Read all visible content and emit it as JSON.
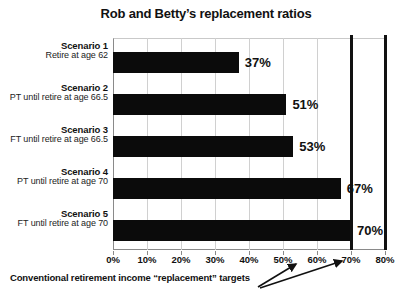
{
  "chart_data": {
    "type": "bar",
    "orientation": "horizontal",
    "title": "Rob and Betty’s replacement ratios",
    "xlabel": "",
    "ylabel": "",
    "xlim": [
      0,
      80
    ],
    "grid": true,
    "legend": "none",
    "categories": [
      "Scenario 1",
      "Scenario 2",
      "Scenario 3",
      "Scenario 4",
      "Scenario 5"
    ],
    "category_sublabels": [
      "Retire at age 62",
      "PT until retire at age 66.5",
      "FT until retire at age 66.5",
      "PT until retire at age 70",
      "FT until retire at age 70"
    ],
    "values": [
      37,
      51,
      53,
      67,
      70
    ],
    "value_labels": [
      "37%",
      "51%",
      "53%",
      "67%",
      "70%"
    ],
    "xticks": [
      0,
      10,
      20,
      30,
      40,
      50,
      60,
      70,
      80
    ],
    "xtick_labels": [
      "0%",
      "10%",
      "20%",
      "30%",
      "40%",
      "50%",
      "60%",
      "70%",
      "80%"
    ],
    "reference_lines": {
      "values": [
        70,
        80
      ],
      "label": "Conventional retirement income “replacement” targets"
    },
    "colors": {
      "bar": "#0b0b0b",
      "reference_line": "#111111",
      "grid": "#d0d0d0",
      "axis": "#8a8a8a",
      "text": "#111111",
      "background": "#ffffff"
    }
  },
  "rows": [
    {
      "title": "Scenario 1",
      "sub": "Retire at age 62",
      "value": 37,
      "label": "37%"
    },
    {
      "title": "Scenario 2",
      "sub": "PT until retire at age 66.5",
      "value": 51,
      "label": "51%"
    },
    {
      "title": "Scenario 3",
      "sub": "FT until retire at age 66.5",
      "value": 53,
      "label": "53%"
    },
    {
      "title": "Scenario 4",
      "sub": "PT until retire at age 70",
      "value": 67,
      "label": "67%"
    },
    {
      "title": "Scenario 5",
      "sub": "FT until retire at age 70",
      "value": 70,
      "label": "70%"
    }
  ],
  "annotation": {
    "text": "Conventional retirement income “replacement” targets"
  }
}
